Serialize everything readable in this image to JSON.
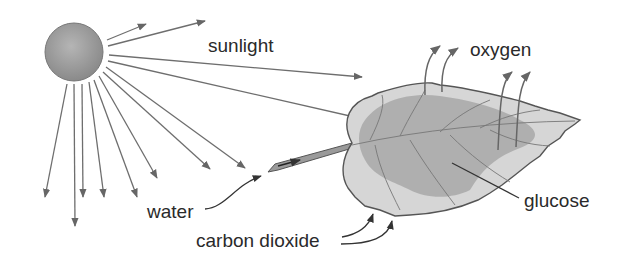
{
  "diagram": {
    "labels": {
      "sunlight": "sunlight",
      "oxygen": "oxygen",
      "water": "water",
      "glucose": "glucose",
      "carbon_dioxide": "carbon dioxide"
    },
    "elements": [
      "sun",
      "sun-rays",
      "leaf",
      "leaf-stem",
      "oxygen-arrows",
      "water-arrow",
      "carbon-dioxide-arrows",
      "glucose-pointer"
    ],
    "colors": {
      "sun": "#9a9a9a",
      "ray": "#6e6e6e",
      "leaf_light": "#d6d6d6",
      "leaf_dark": "#a9a9a9",
      "outline": "#555555",
      "text": "#2a2a2a"
    }
  }
}
